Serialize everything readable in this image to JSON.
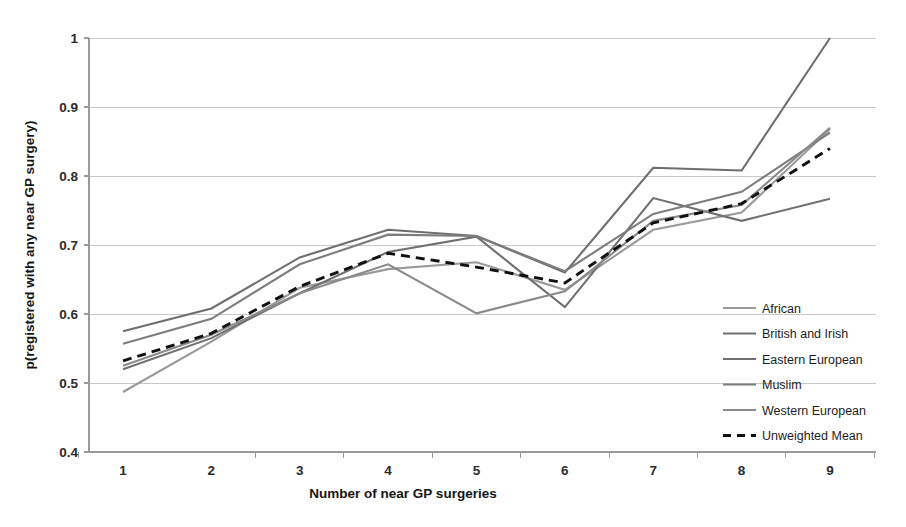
{
  "chart_data": {
    "type": "line",
    "title": "",
    "xlabel": "Number of near GP surgeries",
    "ylabel": "p(registered with any near GP surgery)",
    "x": [
      1,
      2,
      3,
      4,
      5,
      6,
      7,
      8,
      9
    ],
    "xtick_labels": [
      "1",
      "2",
      "3",
      "4",
      "5",
      "6",
      "7",
      "8",
      "9"
    ],
    "ytick_labels": [
      "0.4",
      "0.5",
      "0.6",
      "0.7",
      "0.8",
      "0.9",
      "1"
    ],
    "ytick_values": [
      0.4,
      0.5,
      0.6,
      0.7,
      0.8,
      0.9,
      1.0
    ],
    "ylim": [
      0.4,
      1.0
    ],
    "xlim": [
      1,
      9
    ],
    "grid": "horizontal",
    "legend_position": "right",
    "series": [
      {
        "name": "African",
        "color": "#9a9a9a",
        "style": "solid",
        "values": [
          0.487,
          0.56,
          0.638,
          0.665,
          0.675,
          0.635,
          0.722,
          0.747,
          0.868
        ]
      },
      {
        "name": "British and Irish",
        "color": "#6e6e6e",
        "style": "solid",
        "values": [
          0.575,
          0.608,
          0.682,
          0.722,
          0.713,
          0.66,
          0.812,
          0.808,
          1.0
        ]
      },
      {
        "name": "Eastern European",
        "color": "#707070",
        "style": "solid",
        "values": [
          0.52,
          0.565,
          0.63,
          0.69,
          0.712,
          0.61,
          0.768,
          0.735,
          0.767
        ]
      },
      {
        "name": "Muslim",
        "color": "#7d7d7d",
        "style": "solid",
        "values": [
          0.557,
          0.593,
          0.672,
          0.715,
          0.713,
          0.662,
          0.745,
          0.777,
          0.863
        ]
      },
      {
        "name": "Western European",
        "color": "#8a8a8a",
        "style": "solid",
        "values": [
          0.525,
          0.57,
          0.63,
          0.672,
          0.601,
          0.633,
          0.735,
          0.758,
          0.87
        ]
      },
      {
        "name": "Unweighted Mean",
        "color": "#111111",
        "style": "dashed",
        "values": [
          0.532,
          0.572,
          0.64,
          0.688,
          0.668,
          0.645,
          0.732,
          0.76,
          0.84
        ]
      }
    ]
  },
  "legend": {
    "items": [
      {
        "label": "African"
      },
      {
        "label": "British and Irish"
      },
      {
        "label": "Eastern European"
      },
      {
        "label": "Muslim"
      },
      {
        "label": "Western European"
      },
      {
        "label": "Unweighted Mean"
      }
    ]
  },
  "axes": {
    "x_title": "Number of near GP surgeries",
    "y_title": "p(registered with any near GP surgery)"
  }
}
